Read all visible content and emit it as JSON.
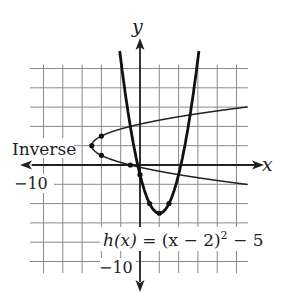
{
  "chart_data": {
    "type": "line",
    "title": "",
    "xlabel": "x",
    "ylabel": "y",
    "xlim": [
      -11.4,
      11.2
    ],
    "ylim": [
      -11.5,
      11.6
    ],
    "grid": true,
    "grid_step": 2,
    "tick_labels": {
      "x": [
        {
          "value": -10,
          "label": "−10"
        }
      ],
      "y": [
        {
          "value": -10,
          "label": "−10"
        }
      ]
    },
    "series": [
      {
        "name": "h(x) = (x − 2)² − 5",
        "label": "h(x) = (x − 2)^2 − 5",
        "type": "function",
        "points": [
          [
            -1,
            4
          ],
          [
            0,
            -1
          ],
          [
            1,
            -4
          ],
          [
            2,
            -5
          ],
          [
            3,
            -4
          ],
          [
            4,
            -1
          ],
          [
            5,
            4
          ]
        ]
      },
      {
        "name": "Inverse",
        "label": "Inverse",
        "type": "inverse",
        "points": [
          [
            4,
            -1
          ],
          [
            -1,
            0
          ],
          [
            -4,
            1
          ],
          [
            -5,
            2
          ],
          [
            -4,
            3
          ],
          [
            -1,
            4
          ],
          [
            4,
            5
          ]
        ]
      }
    ],
    "annotations": [
      {
        "text": "Inverse",
        "x": -9,
        "y": 2.3
      },
      {
        "text": "h(x) = (x − 2)² − 5",
        "x": 0,
        "y": -6
      }
    ]
  },
  "labels": {
    "x_axis": "x",
    "y_axis": "y",
    "x_tick": "−10",
    "y_tick": "−10",
    "inverse": "Inverse",
    "func_h": "h(x)",
    "func_eq": " = (x − 2)",
    "func_exp": "2",
    "func_tail": " − 5"
  }
}
